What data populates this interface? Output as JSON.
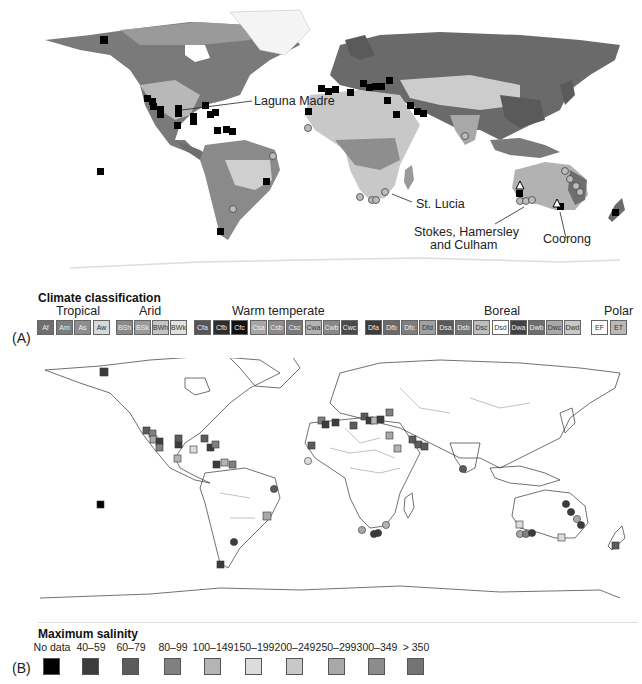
{
  "panel_a": {
    "tag": "(A)",
    "annotations": [
      {
        "id": "laguna-madre",
        "text": "Laguna Madre"
      },
      {
        "id": "st-lucia",
        "text": "St. Lucia"
      },
      {
        "id": "stokes",
        "text": "Stokes, Hamersley"
      },
      {
        "id": "stokes2",
        "text": "and Culham"
      },
      {
        "id": "coorong",
        "text": "Coorong"
      }
    ],
    "legend": {
      "title": "Climate classification",
      "groups": [
        {
          "name": "Tropical",
          "items": [
            {
              "code": "Af",
              "color": "#6e6e6e"
            },
            {
              "code": "Am",
              "color": "#7d7d7d"
            },
            {
              "code": "As",
              "color": "#8e8e8e"
            },
            {
              "code": "Aw",
              "color": "#d8d8d8"
            }
          ]
        },
        {
          "name": "Arid",
          "items": [
            {
              "code": "BSh",
              "color": "#8a8a8a"
            },
            {
              "code": "BSk",
              "color": "#9a9a9a"
            },
            {
              "code": "BWh",
              "color": "#c4c4c4"
            },
            {
              "code": "BWk",
              "color": "#e2e2e2"
            }
          ]
        },
        {
          "name": "Warm temperate",
          "items": [
            {
              "code": "Cfa",
              "color": "#555555"
            },
            {
              "code": "Cfb",
              "color": "#2e2e2e"
            },
            {
              "code": "Cfc",
              "color": "#111111"
            },
            {
              "code": "Csa",
              "color": "#a6a6a6"
            },
            {
              "code": "Csb",
              "color": "#8c8c8c"
            },
            {
              "code": "Csc",
              "color": "#7a7a7a"
            },
            {
              "code": "Cwa",
              "color": "#b2b2b2"
            },
            {
              "code": "Cwb",
              "color": "#888888"
            },
            {
              "code": "Cwc",
              "color": "#4a4a4a"
            }
          ]
        },
        {
          "name": "Boreal",
          "items": [
            {
              "code": "Dfa",
              "color": "#3c3c3c"
            },
            {
              "code": "Dfb",
              "color": "#6a6a6a"
            },
            {
              "code": "Dfc",
              "color": "#7e7e7e"
            },
            {
              "code": "Dfd",
              "color": "#a0a0a0"
            },
            {
              "code": "Dsa",
              "color": "#5a5a5a"
            },
            {
              "code": "Dsb",
              "color": "#767676"
            },
            {
              "code": "Dsc",
              "color": "#bdbdbd"
            },
            {
              "code": "Dsd",
              "color": "#ffffff"
            },
            {
              "code": "Dwa",
              "color": "#424242"
            },
            {
              "code": "Dwb",
              "color": "#6e6e6e"
            },
            {
              "code": "Dwc",
              "color": "#a8a8a8"
            },
            {
              "code": "Dwd",
              "color": "#c8c8c8"
            }
          ]
        },
        {
          "name": "Polar",
          "items": [
            {
              "code": "EF",
              "color": "#ffffff"
            },
            {
              "code": "ET",
              "color": "#b8b8b8"
            }
          ]
        }
      ]
    }
  },
  "panel_b": {
    "tag": "(B)",
    "legend": {
      "title": "Maximum salinity",
      "items": [
        {
          "label": "No data",
          "color": "#000000"
        },
        {
          "label": "40–59",
          "color": "#3c3c3c"
        },
        {
          "label": "60–79",
          "color": "#5c5c5c"
        },
        {
          "label": "80–99",
          "color": "#808080"
        },
        {
          "label": "100–149",
          "color": "#b4b4b4"
        },
        {
          "label": "150–199",
          "color": "#dcdcdc"
        },
        {
          "label": "200–249",
          "color": "#c8c8c8"
        },
        {
          "label": "250–299",
          "color": "#a8a8a8"
        },
        {
          "label": "300–349",
          "color": "#8c8c8c"
        },
        {
          "label": "> 350",
          "color": "#747474"
        }
      ]
    }
  },
  "colors": {
    "site_marker": "#000000",
    "land_outline": "#333333",
    "background": "#ffffff"
  }
}
